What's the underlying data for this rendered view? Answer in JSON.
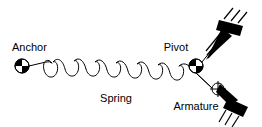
{
  "figure": {
    "background_color": "#ffffff",
    "line_color": "#000000",
    "width": 262,
    "height": 127
  },
  "labels": {
    "anchor": "Anchor",
    "spring": "Spring",
    "pivot": "Pivot",
    "armature": "Armature"
  },
  "components": {
    "anchor_point": {
      "symbol": "quadrant-circle",
      "x": 22,
      "y": 66,
      "r": 7
    },
    "pivot_point": {
      "symbol": "quadrant-circle",
      "x": 196,
      "y": 66,
      "r": 7
    },
    "armature_joint": {
      "symbol": "crosshair-circle",
      "x": 218,
      "y": 89,
      "r": 6
    },
    "spring_coil": {
      "symbol": "helical-coil",
      "loops": 13,
      "start_x": 52,
      "start_y": 62,
      "end_x": 180,
      "end_y": 76
    },
    "upper_ground_block": {
      "symbol": "fixed-support-block",
      "x": 231,
      "y": 23,
      "hatch_lines": 3
    },
    "lower_ground_block": {
      "symbol": "fixed-support-block",
      "x": 236,
      "y": 106,
      "hatch_lines": 3
    },
    "upper_wedge": {
      "symbol": "tapered-wedge",
      "from_x": 200,
      "from_y": 62,
      "to_x": 228,
      "to_y": 30
    },
    "lower_wedge": {
      "symbol": "tapered-wedge",
      "from_x": 219,
      "from_y": 87,
      "to_x": 236,
      "to_y": 104
    }
  }
}
